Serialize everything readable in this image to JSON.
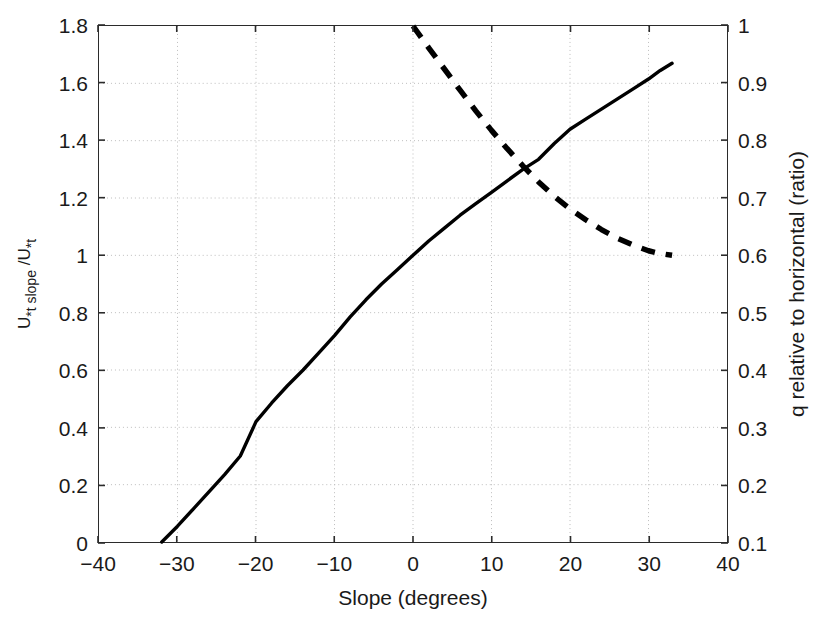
{
  "chart_data": {
    "type": "line",
    "title": "",
    "xlabel": "Slope (degrees)",
    "ylabel_left": "U*t slope /U*t",
    "ylabel_right": "q relative to horizontal (ratio)",
    "xlim": [
      -40,
      40
    ],
    "ylim_left": [
      0,
      1.8
    ],
    "ylim_right": [
      0.1,
      1.0
    ],
    "xticks": [
      -40,
      -30,
      -20,
      -10,
      0,
      10,
      20,
      30,
      40
    ],
    "xtick_labels": [
      "−40",
      "−30",
      "−20",
      "−10",
      "0",
      "10",
      "20",
      "30",
      "40"
    ],
    "yticks_left": [
      0,
      0.2,
      0.4,
      0.6,
      0.8,
      1.0,
      1.2,
      1.4,
      1.6,
      1.8
    ],
    "ytick_labels_left": [
      "0",
      "0.2",
      "0.4",
      "0.6",
      "0.8",
      "1",
      "1.2",
      "1.4",
      "1.6",
      "1.8"
    ],
    "yticks_right": [
      0.1,
      0.2,
      0.3,
      0.4,
      0.5,
      0.6,
      0.7,
      0.8,
      0.9,
      1.0
    ],
    "ytick_labels_right": [
      "0.1",
      "0.2",
      "0.3",
      "0.4",
      "0.5",
      "0.6",
      "0.7",
      "0.8",
      "0.9",
      "1"
    ],
    "grid": true,
    "grid_style": "dotted",
    "grid_color": "#bdbdbd",
    "legend": "none",
    "series": [
      {
        "name": "U*t slope / U*t",
        "axis": "left",
        "style": "solid",
        "color": "#000000",
        "width": 3.4,
        "x": [
          -32,
          -30,
          -28,
          -26,
          -24,
          -22,
          -20,
          -18,
          -16,
          -14,
          -12,
          -10,
          -8,
          -6,
          -4,
          -2,
          0,
          2,
          4,
          6,
          8,
          10,
          12,
          14,
          16,
          18,
          20,
          22,
          24,
          26,
          28,
          30,
          31.5,
          33
        ],
        "y": [
          0.0,
          0.055,
          0.115,
          0.175,
          0.235,
          0.3,
          0.42,
          0.485,
          0.545,
          0.6,
          0.66,
          0.72,
          0.785,
          0.845,
          0.9,
          0.95,
          1.0,
          1.05,
          1.095,
          1.14,
          1.18,
          1.22,
          1.26,
          1.3,
          1.335,
          1.39,
          1.44,
          1.475,
          1.51,
          1.545,
          1.58,
          1.615,
          1.645,
          1.67
        ]
      },
      {
        "name": "q relative to horizontal (ratio)",
        "axis": "right",
        "style": "dashed",
        "color": "#000000",
        "width": 5.5,
        "dash": "14,11",
        "x": [
          0,
          2,
          4,
          6,
          8,
          10,
          12,
          14,
          16,
          18,
          20,
          22,
          24,
          26,
          28,
          30,
          31.5,
          33
        ],
        "y": [
          1.0,
          0.962,
          0.925,
          0.888,
          0.852,
          0.818,
          0.786,
          0.756,
          0.728,
          0.703,
          0.681,
          0.662,
          0.645,
          0.63,
          0.618,
          0.608,
          0.603,
          0.6
        ]
      }
    ],
    "annotations": []
  }
}
